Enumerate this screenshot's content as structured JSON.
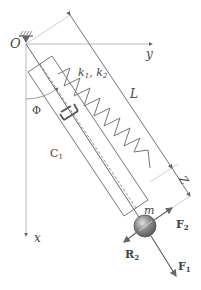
{
  "diagram": {
    "type": "spring-damper pendulum (mass on elastic rod)",
    "labels": {
      "origin": "O",
      "y_axis": "y",
      "x_axis": "x",
      "spring": "k",
      "spring_sub1": "1",
      "spring_sep": ", ",
      "spring2": "k",
      "spring_sub2": "2",
      "length": "L",
      "angle": "Φ",
      "damper": "C",
      "damper_sub": "1",
      "extension": "Z",
      "mass": "m",
      "force2": "F",
      "force2_sub": "2",
      "force1": "F",
      "force1_sub": "1",
      "reaction": "R",
      "reaction_sub": "2"
    },
    "colors": {
      "line": "#666666",
      "light_line": "#9a9a9a",
      "text": "#444444",
      "mass_fill": "#777777",
      "mass_highlight": "#d8d8d8"
    }
  }
}
